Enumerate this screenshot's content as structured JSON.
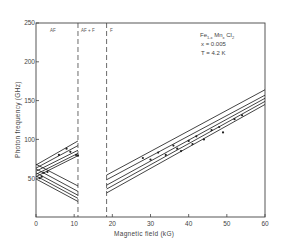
{
  "chart_data": {
    "type": "line",
    "title": "",
    "xlabel": "Magnetic field (kG)",
    "ylabel": "Photon frequency (GHz)",
    "xlim": [
      0,
      60
    ],
    "ylim": [
      0,
      250
    ],
    "xticks": [
      0,
      10,
      20,
      30,
      40,
      50,
      60
    ],
    "yticks": [
      50,
      100,
      150,
      200,
      250
    ],
    "ytick_labels_shown": [
      "50",
      "100",
      "150",
      "200",
      "250"
    ],
    "xtick_labels_shown": [
      "0",
      "10",
      "20",
      "30",
      "40",
      "50",
      "60"
    ],
    "grid": false,
    "annotations": {
      "material": "Fe1-x Mnx Cl2",
      "composition": "x = 0.005",
      "temperature": "T = 4.2 K"
    },
    "phase_boundaries": [
      {
        "x": 11,
        "style": "dashed"
      },
      {
        "x": 18.5,
        "style": "dashed"
      }
    ],
    "regions": [
      {
        "label": "AF",
        "x_range": [
          0,
          11
        ]
      },
      {
        "label": "AF + F",
        "x_range": [
          11,
          18.5
        ]
      },
      {
        "label": "F",
        "x_range": [
          18.5,
          60
        ]
      }
    ],
    "series": [
      {
        "name": "AF rising 1",
        "x": [
          0,
          11
        ],
        "y": [
          67,
          98
        ]
      },
      {
        "name": "AF rising 2",
        "x": [
          0,
          11
        ],
        "y": [
          63,
          92
        ]
      },
      {
        "name": "AF rising 3",
        "x": [
          0,
          11
        ],
        "y": [
          59,
          86
        ]
      },
      {
        "name": "AF rising 4",
        "x": [
          0,
          11
        ],
        "y": [
          55,
          82
        ]
      },
      {
        "name": "AF rising 5",
        "x": [
          0,
          11
        ],
        "y": [
          52,
          79
        ]
      },
      {
        "name": "AF falling 1",
        "x": [
          0,
          11
        ],
        "y": [
          68,
          40
        ]
      },
      {
        "name": "AF falling 2",
        "x": [
          0,
          11
        ],
        "y": [
          62,
          33
        ]
      },
      {
        "name": "AF falling 3",
        "x": [
          0,
          11
        ],
        "y": [
          57,
          28
        ]
      },
      {
        "name": "AF falling 4",
        "x": [
          0,
          11
        ],
        "y": [
          53,
          24
        ]
      },
      {
        "name": "AF falling 5",
        "x": [
          0,
          11
        ],
        "y": [
          49,
          20
        ]
      },
      {
        "name": "F branch 1",
        "x": [
          18.5,
          60
        ],
        "y": [
          54,
          164
        ]
      },
      {
        "name": "F branch 2",
        "x": [
          18.5,
          60
        ],
        "y": [
          48,
          157
        ]
      },
      {
        "name": "F branch 3",
        "x": [
          18.5,
          60
        ],
        "y": [
          41,
          153
        ]
      },
      {
        "name": "F branch 4",
        "x": [
          18.5,
          60
        ],
        "y": [
          36,
          149
        ]
      },
      {
        "name": "F branch 5",
        "x": [
          18.5,
          60
        ],
        "y": [
          31,
          145
        ]
      }
    ],
    "data_points": [
      {
        "x": 2,
        "y": 57
      },
      {
        "x": 3,
        "y": 58
      },
      {
        "x": 1,
        "y": 50
      },
      {
        "x": 1.5,
        "y": 52
      },
      {
        "x": 6,
        "y": 80
      },
      {
        "x": 8,
        "y": 88
      },
      {
        "x": 9,
        "y": 84
      },
      {
        "x": 10.5,
        "y": 80
      },
      {
        "x": 11,
        "y": 79
      },
      {
        "x": 28,
        "y": 76
      },
      {
        "x": 30,
        "y": 74
      },
      {
        "x": 32,
        "y": 83
      },
      {
        "x": 34,
        "y": 80
      },
      {
        "x": 36,
        "y": 92
      },
      {
        "x": 37,
        "y": 88
      },
      {
        "x": 38,
        "y": 85
      },
      {
        "x": 40,
        "y": 98
      },
      {
        "x": 41,
        "y": 94
      },
      {
        "x": 42,
        "y": 104
      },
      {
        "x": 44,
        "y": 100
      },
      {
        "x": 46,
        "y": 112
      },
      {
        "x": 48,
        "y": 116
      },
      {
        "x": 49,
        "y": 109
      },
      {
        "x": 52,
        "y": 126
      },
      {
        "x": 54,
        "y": 131
      }
    ]
  },
  "labels": {
    "xlabel": "Magnetic field (kG)",
    "ylabel": "Photon frequency (GHz)",
    "region_af": "AF",
    "region_af_f": "AF + F",
    "region_f": "F",
    "legend_material_base": "Fe",
    "legend_material_sub1": "1-x",
    "legend_material_mid": " Mn",
    "legend_material_sub2": "x",
    "legend_material_end": " Cl",
    "legend_material_sub3": "2",
    "legend_composition": "x = 0.005",
    "legend_temperature": "T = 4.2 K"
  },
  "colors": {
    "line": "#222222",
    "axis": "#444444",
    "background": "#ffffff"
  }
}
